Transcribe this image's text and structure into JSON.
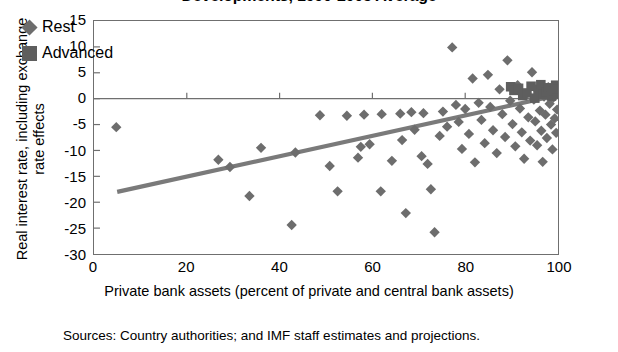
{
  "chart_data": {
    "type": "scatter",
    "title": "Developments, 1990-2005 Average",
    "xlabel": "Private bank assets (percent of private and central bank assets)",
    "ylabel": "Real interest rate, including exchange rate effects",
    "source": "Sources: Country authorities; and IMF staff estimates and projections.",
    "xlim": [
      0,
      100
    ],
    "ylim": [
      -30,
      15
    ],
    "xticks": [
      0,
      20,
      40,
      60,
      80,
      100
    ],
    "yticks": [
      15,
      10,
      5,
      0,
      -5,
      -10,
      -15,
      -20,
      -25,
      -30
    ],
    "grid": false,
    "zero_line": true,
    "legend_position": "top-left",
    "legend": [
      {
        "name": "Rest",
        "marker": "diamond",
        "color": "#6d6d6d"
      },
      {
        "name": "Advanced",
        "marker": "square",
        "color": "#5e5e5e"
      }
    ],
    "trendline": {
      "name": "linear fit",
      "color": "#7a7a7a",
      "x": [
        5,
        100
      ],
      "y": [
        -18.0,
        0.7
      ]
    },
    "series": [
      {
        "name": "Rest",
        "marker": "diamond",
        "color": "#6d6d6d",
        "points": [
          [
            4.8,
            -5.5
          ],
          [
            26.8,
            -11.8
          ],
          [
            29.3,
            -13.2
          ],
          [
            33.5,
            -18.8
          ],
          [
            36.0,
            -9.5
          ],
          [
            42.6,
            -24.4
          ],
          [
            43.4,
            -10.4
          ],
          [
            48.7,
            -3.2
          ],
          [
            50.8,
            -13.0
          ],
          [
            52.5,
            -17.9
          ],
          [
            54.5,
            -3.3
          ],
          [
            56.9,
            -11.4
          ],
          [
            57.5,
            -9.3
          ],
          [
            59.4,
            -8.8
          ],
          [
            61.8,
            -17.9
          ],
          [
            64.2,
            -12.0
          ],
          [
            66.4,
            -8.0
          ],
          [
            67.2,
            -22.1
          ],
          [
            68.4,
            -2.6
          ],
          [
            69.1,
            -6.0
          ],
          [
            70.6,
            -11.1
          ],
          [
            71.9,
            -12.6
          ],
          [
            72.6,
            -17.5
          ],
          [
            73.4,
            -25.8
          ],
          [
            74.5,
            -7.2
          ],
          [
            75.2,
            -2.5
          ],
          [
            76.1,
            -5.4
          ],
          [
            77.2,
            9.9
          ],
          [
            78.0,
            -1.2
          ],
          [
            78.6,
            -4.5
          ],
          [
            79.3,
            -9.7
          ],
          [
            80.0,
            -2.0
          ],
          [
            80.8,
            -6.8
          ],
          [
            81.6,
            3.9
          ],
          [
            82.1,
            -12.3
          ],
          [
            82.9,
            -0.8
          ],
          [
            83.5,
            -4.1
          ],
          [
            84.2,
            -8.6
          ],
          [
            84.9,
            4.6
          ],
          [
            85.4,
            -1.6
          ],
          [
            86.0,
            -6.1
          ],
          [
            86.8,
            -10.5
          ],
          [
            87.4,
            1.8
          ],
          [
            88.0,
            -3.0
          ],
          [
            88.6,
            -7.4
          ],
          [
            89.1,
            7.4
          ],
          [
            89.7,
            -0.4
          ],
          [
            90.2,
            -4.9
          ],
          [
            90.8,
            -9.2
          ],
          [
            91.3,
            2.6
          ],
          [
            91.8,
            -1.9
          ],
          [
            92.2,
            -6.5
          ],
          [
            92.7,
            -11.6
          ],
          [
            93.1,
            0.9
          ],
          [
            93.6,
            -3.6
          ],
          [
            94.0,
            -8.1
          ],
          [
            94.4,
            5.1
          ],
          [
            94.8,
            -0.2
          ],
          [
            95.1,
            -4.4
          ],
          [
            95.5,
            -9.0
          ],
          [
            95.8,
            1.4
          ],
          [
            96.1,
            -2.3
          ],
          [
            96.4,
            -6.2
          ],
          [
            96.7,
            -12.2
          ],
          [
            97.0,
            0.4
          ],
          [
            97.3,
            -3.1
          ],
          [
            97.6,
            -7.6
          ],
          [
            97.9,
            2.2
          ],
          [
            98.2,
            -1.0
          ],
          [
            98.5,
            -5.0
          ],
          [
            98.8,
            -9.8
          ],
          [
            99.0,
            0.2
          ],
          [
            99.3,
            -3.8
          ],
          [
            99.6,
            -6.6
          ],
          [
            99.8,
            -2.1
          ],
          [
            71.0,
            -2.8
          ],
          [
            66.0,
            -2.9
          ],
          [
            62.0,
            -3.0
          ],
          [
            58.2,
            -3.1
          ]
        ]
      },
      {
        "name": "Advanced",
        "marker": "square",
        "color": "#5e5e5e",
        "points": [
          [
            89.8,
            2.3
          ],
          [
            90.5,
            1.6
          ],
          [
            91.5,
            2.0
          ],
          [
            92.4,
            0.6
          ],
          [
            93.3,
            1.1
          ],
          [
            94.2,
            2.4
          ],
          [
            95.0,
            0.1
          ],
          [
            95.7,
            1.8
          ],
          [
            96.3,
            2.7
          ],
          [
            96.9,
            0.8
          ],
          [
            97.5,
            1.3
          ],
          [
            98.0,
            2.1
          ],
          [
            98.6,
            0.5
          ],
          [
            99.1,
            1.5
          ],
          [
            99.5,
            2.6
          ],
          [
            99.9,
            0.9
          ],
          [
            99.9,
            1.9
          ]
        ]
      }
    ]
  }
}
